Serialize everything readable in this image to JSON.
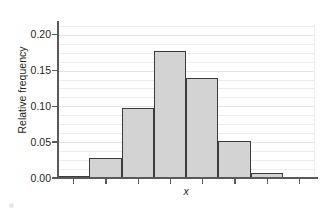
{
  "chart_data": {
    "type": "bar",
    "title": "",
    "subtitle": "",
    "xlabel": "x",
    "ylabel": "Relative frequency",
    "grid": true,
    "legend": null,
    "ylim": [
      0.0,
      0.215
    ],
    "ytick_labels": [
      "0.00",
      "0.05",
      "0.10",
      "0.15",
      "0.20"
    ],
    "ytick_values": [
      0.0,
      0.05,
      0.1,
      0.15,
      0.2
    ],
    "minor_gridline_step": 0.0125,
    "categories": [
      "1",
      "2",
      "3",
      "4",
      "5",
      "6",
      "7",
      "8"
    ],
    "values": [
      0.002,
      0.028,
      0.098,
      0.178,
      0.14,
      0.051,
      0.007,
      0.0
    ],
    "bar_fill_color": "#d3d3d3",
    "bar_edge_color": "#3b3b3b",
    "axis_color": "#58595b",
    "grid_color": "#ececec",
    "text_color": "#231f20",
    "n_bins": 8,
    "bin_edges_fraction": [
      0.0,
      0.125,
      0.25,
      0.375,
      0.5,
      0.625,
      0.75,
      0.875,
      1.0
    ],
    "xtick_positions_fraction": [
      0.0625,
      0.1875,
      0.3125,
      0.4375,
      0.5625,
      0.6875,
      0.8125,
      0.9375
    ]
  }
}
